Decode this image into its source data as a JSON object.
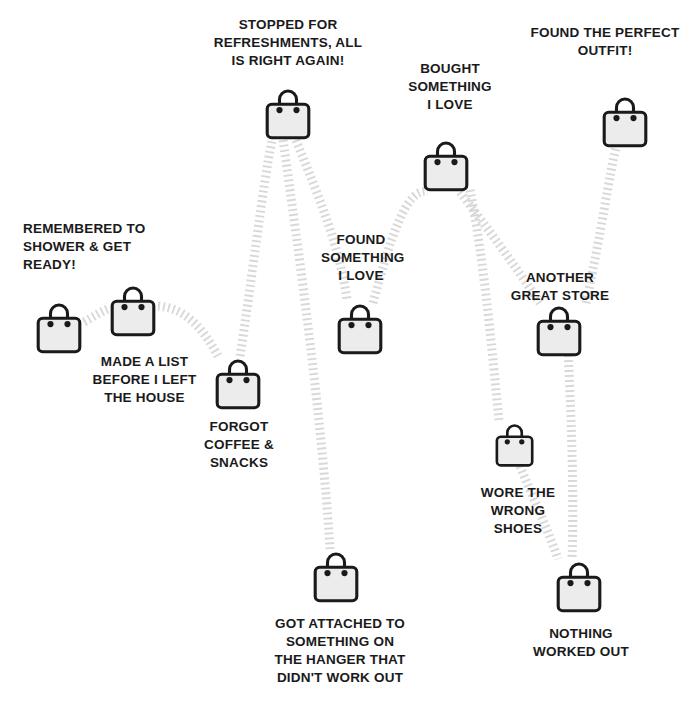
{
  "infographic": {
    "title_text": "",
    "theme": {
      "background": "#ffffff",
      "text_color": "#1a1a1a",
      "bag_outline": "#1a1a1a",
      "bag_fill": "#ececec",
      "trail_color": "#d8d8d8"
    },
    "icon_name": "shopping-bag-icon",
    "steps": [
      {
        "id": "step-1",
        "label": "REMEMBERED TO\nSHOWER & GET\nREADY!",
        "align": "left",
        "bag": {
          "x": 36,
          "y": 302,
          "size": 1.0
        },
        "text": {
          "x": 23,
          "y": 220,
          "w": 160,
          "align": "lft"
        }
      },
      {
        "id": "step-2",
        "label": "MADE A LIST\nBEFORE I LEFT\nTHE HOUSE",
        "align": "center",
        "bag": {
          "x": 110,
          "y": 285,
          "size": 1.0
        },
        "text": {
          "x": 77,
          "y": 353,
          "w": 135,
          "align": "ctr"
        }
      },
      {
        "id": "step-3",
        "label": "FORGOT\nCOFFEE &\nSNACKS",
        "align": "center",
        "bag": {
          "x": 215,
          "y": 358,
          "size": 1.0
        },
        "text": {
          "x": 183,
          "y": 418,
          "w": 112,
          "align": "ctr"
        }
      },
      {
        "id": "step-4",
        "label": "STOPPED FOR\nREFRESHMENTS, ALL\nIS RIGHT AGAIN!",
        "align": "center",
        "bag": {
          "x": 265,
          "y": 88,
          "size": 1.0
        },
        "text": {
          "x": 198,
          "y": 16,
          "w": 180,
          "align": "ctr"
        }
      },
      {
        "id": "step-5",
        "label": "GOT ATTACHED TO\nSOMETHING ON\nTHE HANGER THAT\nDIDN'T WORK OUT",
        "align": "center",
        "bag": {
          "x": 313,
          "y": 551,
          "size": 1.0
        },
        "text": {
          "x": 246,
          "y": 615,
          "w": 188,
          "align": "ctr"
        }
      },
      {
        "id": "step-6",
        "label": "FOUND\nSOMETHING\nI LOVE",
        "align": "center",
        "bag": {
          "x": 337,
          "y": 303,
          "size": 1.0
        },
        "text": {
          "x": 321,
          "y": 231,
          "w": 80,
          "align": "ctr"
        }
      },
      {
        "id": "step-7",
        "label": "BOUGHT\nSOMETHING\nI LOVE",
        "align": "center",
        "bag": {
          "x": 423,
          "y": 140,
          "size": 1.0
        },
        "text": {
          "x": 404,
          "y": 60,
          "w": 92,
          "align": "ctr"
        }
      },
      {
        "id": "step-8",
        "label": "ANOTHER\nGREAT STORE",
        "align": "center",
        "bag": {
          "x": 536,
          "y": 305,
          "size": 1.0
        },
        "text": {
          "x": 504,
          "y": 269,
          "w": 112,
          "align": "ctr"
        }
      },
      {
        "id": "step-9",
        "label": "WORE THE\nWRONG SHOES",
        "align": "center",
        "bag": {
          "x": 495,
          "y": 423,
          "size": 0.85
        },
        "text": {
          "x": 470,
          "y": 484,
          "w": 96,
          "align": "ctr"
        }
      },
      {
        "id": "step-10",
        "label": "NOTHING\nWORKED OUT",
        "align": "center",
        "bag": {
          "x": 556,
          "y": 561,
          "size": 1.0
        },
        "text": {
          "x": 526,
          "y": 625,
          "w": 110,
          "align": "ctr"
        }
      },
      {
        "id": "step-11",
        "label": "FOUND THE PERFECT\nOUTFIT!",
        "align": "center",
        "bag": {
          "x": 602,
          "y": 96,
          "size": 1.0
        },
        "text": {
          "x": 517,
          "y": 24,
          "w": 176,
          "align": "ctr"
        }
      }
    ],
    "trails": [
      {
        "id": "trail-1-2",
        "d": "M 84,322 C 95,316 100,312 110,308"
      },
      {
        "id": "trail-2-3",
        "d": "M 158,306 C 186,308 204,330 218,356"
      },
      {
        "id": "trail-3-4",
        "d": "M 240,356 C 252,280 262,190 272,140"
      },
      {
        "id": "trail-4-5",
        "d": "M 283,140 C 300,260 322,420 330,549"
      },
      {
        "id": "trail-4-6",
        "d": "M 296,140 C 320,200 340,248 347,300"
      },
      {
        "id": "trail-6-7",
        "d": "M 373,303 C 390,240 406,186 428,192"
      },
      {
        "id": "trail-7-8",
        "d": "M 460,192 C 486,226 518,270 540,303"
      },
      {
        "id": "trail-7-9",
        "d": "M 470,190 C 484,260 492,350 499,421"
      },
      {
        "id": "trail-8-10",
        "d": "M 568,350 C 572,430 574,500 572,559"
      },
      {
        "id": "trail-9-10",
        "d": "M 520,466 C 534,500 548,530 558,559"
      },
      {
        "id": "trail-8-11",
        "d": "M 586,303 C 600,240 610,170 616,148"
      }
    ]
  }
}
